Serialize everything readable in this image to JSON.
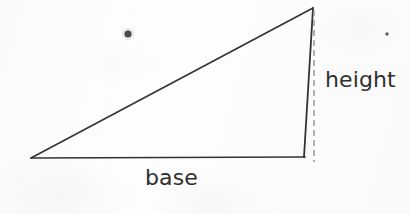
{
  "figure": {
    "background_color": "#fdfdfd",
    "stroke_color": "#333333",
    "dashed_color": "#9a9a9a",
    "text_color": "#2f2f2f",
    "labels": {
      "base": "base",
      "height": "height"
    },
    "geometry": {
      "left_vertex": [
        31,
        158
      ],
      "apex_vertex": [
        313,
        8
      ],
      "right_vertex": [
        304,
        157
      ],
      "dashed_line": {
        "x": 314,
        "y_top": 10,
        "y_bottom": 162
      }
    },
    "artifacts": [
      {
        "name": "large-ink-spot",
        "cx": 128,
        "cy": 34,
        "r": 3.6
      },
      {
        "name": "small-ink-spot",
        "cx": 387,
        "cy": 34,
        "r": 1.7
      }
    ]
  }
}
